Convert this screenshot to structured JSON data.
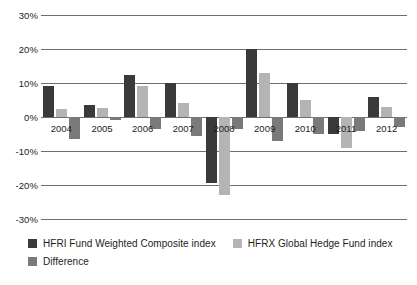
{
  "chart_data": {
    "type": "bar",
    "title": "",
    "subtitle": "",
    "xlabel": "",
    "ylabel": "",
    "categories": [
      "2004",
      "2005",
      "2006",
      "2007",
      "2008",
      "2009",
      "2010",
      "2011",
      "2012"
    ],
    "series": [
      {
        "name": "HFRI Fund Weighted Composite index",
        "color": "#3a3a3a",
        "values": [
          9.0,
          3.5,
          12.5,
          10.0,
          -19.5,
          20.0,
          10.0,
          -5.0,
          6.0
        ]
      },
      {
        "name": "HFRX Global Hedge Fund index",
        "color": "#b4b4b4",
        "values": [
          2.5,
          2.7,
          9.0,
          4.0,
          -23.0,
          13.0,
          5.0,
          -9.0,
          3.0
        ]
      },
      {
        "name": "Difference",
        "color": "#7a7a7a",
        "values": [
          -6.5,
          -0.8,
          -3.5,
          -5.5,
          -3.5,
          -7.0,
          -5.0,
          -4.0,
          -3.0
        ]
      }
    ],
    "ylim": [
      -30,
      30
    ],
    "yticks": [
      30,
      20,
      10,
      0,
      -10,
      -20,
      -30
    ],
    "ytick_labels": [
      "30%",
      "20%",
      "10%",
      "0%",
      "-10%",
      "-20%",
      "-30%"
    ],
    "grid": true,
    "legend_position": "bottom-left",
    "value_suffix": "%"
  },
  "legend": {
    "items": [
      {
        "label": "HFRI Fund Weighted Composite index",
        "color": "#3a3a3a"
      },
      {
        "label": "HFRX Global Hedge Fund index",
        "color": "#b4b4b4"
      },
      {
        "label": "Difference",
        "color": "#7a7a7a"
      }
    ]
  },
  "colors": {
    "gridline": "#6e6e6e",
    "text": "#1d1d1d",
    "background": "#ffffff"
  }
}
